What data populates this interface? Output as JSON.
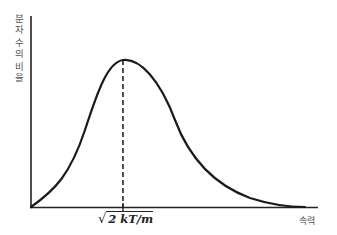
{
  "chart_data": {
    "type": "line",
    "title": "",
    "ylabel": "분자 수의 비율",
    "xlabel": "속력",
    "x_ticks": [
      {
        "position": 123,
        "label": "√2kT/m"
      }
    ],
    "annotation": {
      "type": "dashed-vertical-line",
      "at": "most probable speed",
      "label": "√2kT/m"
    },
    "grid": false,
    "legend": null,
    "axes": {
      "origin_px": [
        31,
        207
      ],
      "y_top_px": 16,
      "x_end_px": 318
    },
    "series": [
      {
        "name": "Maxwell-Boltzmann distribution",
        "x_px": [
          31,
          45,
          60,
          75,
          90,
          105,
          115,
          123,
          135,
          150,
          165,
          180,
          195,
          210,
          225,
          240,
          255,
          270,
          285,
          300
        ],
        "y_px": [
          207,
          196,
          181,
          157,
          122,
          86,
          68,
          60,
          64,
          80,
          103,
          132,
          158,
          177,
          190,
          198,
          203,
          205.5,
          206.5,
          207
        ]
      }
    ],
    "curve_path": "M31,207 C55,190 70,175 85,130 C98,90 108,62 123,60 C140,58 160,80 175,120 C190,160 215,185 250,198 C275,206 295,207 305,207",
    "axis_color": "#222222",
    "curve_color": "#1a1a1a"
  },
  "labels": {
    "y_axis_chars": [
      "분",
      "자",
      "",
      "수",
      "의",
      "",
      "비",
      "율"
    ],
    "x_axis": "속력",
    "peak_radical": "√",
    "peak_value": "2 kT/m"
  }
}
